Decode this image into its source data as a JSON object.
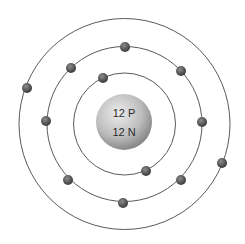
{
  "diagram": {
    "center": {
      "x": 124.5,
      "y": 124
    },
    "nucleus": {
      "line1": "12 P",
      "line2": "12 N",
      "fill_light": "#e6e6e6",
      "fill_dark": "#8a8a8a",
      "radius": 28
    },
    "orbits": [
      {
        "name": "inner-shell",
        "radius": 51,
        "electron_count": 2
      },
      {
        "name": "middle-shell",
        "radius": 77.5,
        "electron_count": 8
      },
      {
        "name": "outer-shell",
        "radius": 105.5,
        "electron_count": 2
      }
    ],
    "electrons": [
      {
        "shell": 1,
        "x": 103,
        "y": 78
      },
      {
        "shell": 1,
        "x": 146,
        "y": 171
      },
      {
        "shell": 2,
        "x": 125,
        "y": 47
      },
      {
        "shell": 2,
        "x": 181,
        "y": 71
      },
      {
        "shell": 2,
        "x": 202,
        "y": 122
      },
      {
        "shell": 2,
        "x": 181,
        "y": 180
      },
      {
        "shell": 2,
        "x": 123,
        "y": 203
      },
      {
        "shell": 2,
        "x": 68,
        "y": 180
      },
      {
        "shell": 2,
        "x": 46,
        "y": 121
      },
      {
        "shell": 2,
        "x": 71,
        "y": 68
      },
      {
        "shell": 3,
        "x": 222,
        "y": 163
      },
      {
        "shell": 3,
        "x": 27,
        "y": 88
      }
    ],
    "colors": {
      "orbit_stroke": "#5a5a5a",
      "electron_light": "#8c8c8c",
      "electron_dark": "#3a3a3a"
    }
  }
}
